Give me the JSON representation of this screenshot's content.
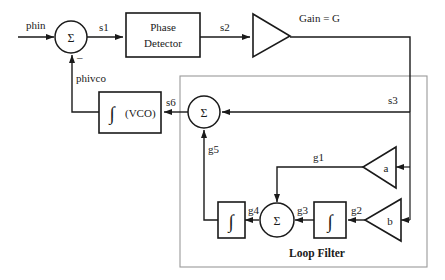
{
  "diagram": {
    "colors": {
      "ink": "#1a1a1a",
      "group_border": "#9a9a9a",
      "background": "#ffffff"
    },
    "blocks": {
      "sum1": {
        "symbol": "Σ",
        "name": "input-summing-junction"
      },
      "sum2": {
        "symbol": "Σ",
        "name": "loop-filter-output-summing-junction"
      },
      "sum3": {
        "symbol": "Σ",
        "name": "inner-summing-junction"
      },
      "phase_detector": {
        "line1": "Phase",
        "line2": "Detector"
      },
      "gain": {
        "label": "Gain = G"
      },
      "vco": {
        "symbol": "∫",
        "label": "(VCO)"
      },
      "integrator_left": {
        "symbol": "∫"
      },
      "integrator_right": {
        "symbol": "∫"
      },
      "gain_a": {
        "label": "a"
      },
      "gain_b": {
        "label": "b"
      },
      "loop_filter": {
        "label": "Loop Filter"
      }
    },
    "signals": {
      "phin": "phin",
      "s1": "s1",
      "s2": "s2",
      "s3": "s3",
      "s6": "s6",
      "phivco": "phivco",
      "minus": "–",
      "g1": "g1",
      "g2": "g2",
      "g3": "g3",
      "g4": "g4",
      "g5": "g5"
    }
  }
}
